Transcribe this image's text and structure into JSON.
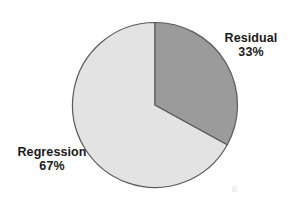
{
  "chart_data": {
    "type": "pie",
    "title": "",
    "subtitle": "",
    "xlabel": "",
    "ylabel": "",
    "legend_position": "none",
    "grid": false,
    "labels": [
      "Residual",
      "Regression"
    ],
    "values": [
      33,
      67
    ],
    "unit": "%",
    "slices": [
      {
        "name": "Residual",
        "value": 33,
        "value_label": "33%",
        "color": "#9b9b9b",
        "start_angle_deg": 0,
        "end_angle_deg": 118.8
      },
      {
        "name": "Regression",
        "value": 67,
        "value_label": "67%",
        "color": "#e3e3e3",
        "start_angle_deg": 118.8,
        "end_angle_deg": 360
      }
    ],
    "annotations": [
      {
        "id": "residual",
        "name": "Residual",
        "value_label": "33%"
      },
      {
        "id": "regression",
        "name": "Regression",
        "value_label": "67%"
      }
    ]
  },
  "style": {
    "background": "#ffffff",
    "outline_color": "#5a5a5a",
    "label_color": "#1a1a1a"
  }
}
